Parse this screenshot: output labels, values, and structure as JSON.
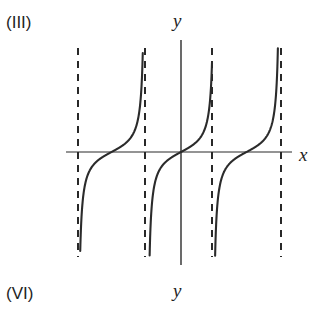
{
  "figure": {
    "top_left_label": "(III)",
    "bottom_left_label": "(VI)",
    "y_axis_label_top": "y",
    "x_axis_label_right": "x",
    "y_axis_label_bottom": "y",
    "background_color": "#ffffff",
    "curve_color": "#2b2b2b",
    "axis_color": "#2b2b2b",
    "asymptote_color": "#1f1f1f"
  },
  "chart_data": {
    "type": "line",
    "title": "",
    "subtitle": "",
    "xlabel": "x",
    "ylabel": "y",
    "grid": false,
    "legend": null,
    "axes": {
      "x_axis_y_pixel": 152,
      "y_axis_x_pixel": 181,
      "x_axis_start_pixel": 66,
      "x_axis_end_pixel": 292,
      "y_axis_top_pixel": 40,
      "y_axis_bottom_pixel": 265
    },
    "asymptotes": {
      "style": "dashed",
      "x_pixels": [
        78,
        145,
        212,
        281
      ],
      "top_pixel": 48,
      "bottom_pixel": 257,
      "period_pixels": 67.5
    },
    "branches": [
      {
        "center_x_pixel": 111.5,
        "zero_crossing_x_pixel": 111.5,
        "left_asymptote_pixel": 78,
        "right_asymptote_pixel": 145
      },
      {
        "center_x_pixel": 178.5,
        "zero_crossing_x_pixel": 181,
        "left_asymptote_pixel": 145,
        "right_asymptote_pixel": 212
      },
      {
        "center_x_pixel": 246.5,
        "zero_crossing_x_pixel": 246.5,
        "left_asymptote_pixel": 212,
        "right_asymptote_pixel": 281
      }
    ],
    "series": [
      {
        "name": "tangent-like curve",
        "shape": "monotonic increasing between consecutive vertical asymptotes",
        "zero_crossings_x_pixels": [
          111.5,
          181,
          246.5
        ]
      }
    ],
    "ylim": [
      null,
      null
    ],
    "xlim": [
      null,
      null
    ]
  }
}
